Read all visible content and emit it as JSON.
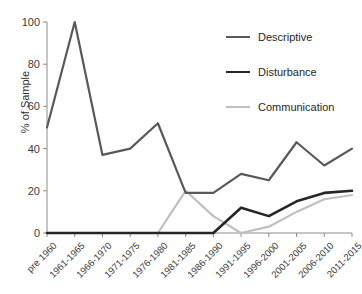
{
  "chart_data": {
    "type": "line",
    "title": "",
    "xlabel": "",
    "ylabel": "% of Sample",
    "ylim": [
      0,
      100
    ],
    "yticks": [
      0,
      20,
      40,
      60,
      80,
      100
    ],
    "grid": false,
    "legend_position": "top-right",
    "categories": [
      "pre 1960",
      "1961-1965",
      "1966-1970",
      "1971-1975",
      "1976-1980",
      "1981-1985",
      "1986-1990",
      "1991-1995",
      "1996-2000",
      "2001-2005",
      "2006-2010",
      "2011-2015"
    ],
    "series": [
      {
        "name": "Descriptive",
        "color": "#595959",
        "values": [
          50,
          100,
          37,
          40,
          52,
          19,
          19,
          28,
          25,
          43,
          32,
          40
        ]
      },
      {
        "name": "Disturbance",
        "color": "#262626",
        "values": [
          0,
          0,
          0,
          0,
          0,
          0,
          0,
          12,
          8,
          15,
          19,
          20
        ]
      },
      {
        "name": "Communication",
        "color": "#bfbfbf",
        "values": [
          0,
          0,
          0,
          0,
          0,
          20,
          8,
          0,
          3,
          10,
          16,
          18
        ]
      }
    ]
  },
  "axis": {
    "y_title": "% of Sample",
    "y_tick_labels": [
      "0",
      "20",
      "40",
      "60",
      "80",
      "100"
    ]
  },
  "legend": {
    "items": [
      {
        "label": "Descriptive",
        "color": "#595959",
        "width": "2.2px"
      },
      {
        "label": "Disturbance",
        "color": "#262626",
        "width": "2.6px"
      },
      {
        "label": "Communication",
        "color": "#bfbfbf",
        "width": "2.2px"
      }
    ]
  }
}
